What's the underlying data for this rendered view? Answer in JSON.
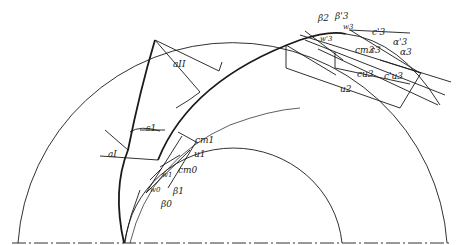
{
  "diagram": {
    "type": "impeller blade velocity triangles",
    "labels": {
      "a_II": "aII",
      "a_I": "aI",
      "s1": "s1",
      "cm1": "cm1",
      "u1": "u1",
      "cm0": "cm0",
      "w1": "w1",
      "w0": "w0",
      "beta1": "β1",
      "beta0": "β0",
      "beta2": "β2",
      "beta3p": "β'3",
      "w3": "w3",
      "w3p": "w'3",
      "c3p": "c'3",
      "c3": "c3",
      "alpha3p": "α'3",
      "alpha3": "α3",
      "cm3": "cm3",
      "cu3": "cu3",
      "cu3p": "c'u3",
      "u2": "u2"
    },
    "colors": {
      "line": "#1a1a1a",
      "background": "#ffffff"
    }
  }
}
